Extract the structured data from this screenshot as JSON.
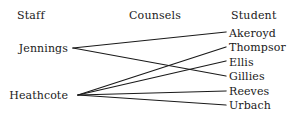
{
  "diagram": {
    "type": "bipartite-relationship-diagram",
    "headers": {
      "left": "Staff",
      "middle": "Counsels",
      "right": "Student"
    },
    "staff": [
      {
        "id": "jennings",
        "label": "Jennings"
      },
      {
        "id": "heathcote",
        "label": "Heathcote"
      }
    ],
    "students": [
      {
        "id": "akeroyd",
        "label": "Akeroyd"
      },
      {
        "id": "thompson",
        "label": "Thompsor"
      },
      {
        "id": "ellis",
        "label": "Ellis"
      },
      {
        "id": "gillies",
        "label": "Gillies"
      },
      {
        "id": "reeves",
        "label": "Reeves"
      },
      {
        "id": "urbach",
        "label": "Urbach"
      }
    ],
    "edges": [
      {
        "from": "jennings",
        "to": "akeroyd"
      },
      {
        "from": "jennings",
        "to": "gillies"
      },
      {
        "from": "heathcote",
        "to": "thompson"
      },
      {
        "from": "heathcote",
        "to": "ellis"
      },
      {
        "from": "heathcote",
        "to": "reeves"
      },
      {
        "from": "heathcote",
        "to": "urbach"
      }
    ],
    "colors": {
      "background": "#ffffff",
      "text": "#1a1a1a",
      "line": "#1a1a1a"
    }
  }
}
